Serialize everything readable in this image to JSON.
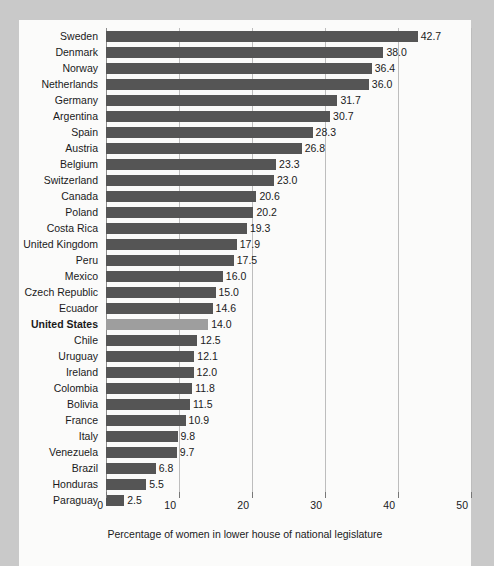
{
  "chart_data": {
    "type": "bar",
    "orientation": "horizontal",
    "title": "",
    "xlabel": "Percentage of women in lower house of national legislature",
    "ylabel": "",
    "xlim": [
      0,
      50
    ],
    "xticks": [
      0,
      10,
      20,
      30,
      40,
      50
    ],
    "xtick_labels": [
      "0",
      "10",
      "20",
      "30",
      "40",
      "50"
    ],
    "grid": true,
    "legend": null,
    "bar_color": "#555555",
    "highlight_color": "#9e9e9e",
    "highlight_category": "United States",
    "categories": [
      "Sweden",
      "Denmark",
      "Norway",
      "Netherlands",
      "Germany",
      "Argentina",
      "Spain",
      "Austria",
      "Belgium",
      "Switzerland",
      "Canada",
      "Poland",
      "Costa Rica",
      "United Kingdom",
      "Peru",
      "Mexico",
      "Czech Republic",
      "Ecuador",
      "United States",
      "Chile",
      "Uruguay",
      "Ireland",
      "Colombia",
      "Bolivia",
      "France",
      "Italy",
      "Venezuela",
      "Brazil",
      "Honduras",
      "Paraguay"
    ],
    "values": [
      42.7,
      38.0,
      36.4,
      36.0,
      31.7,
      30.7,
      28.3,
      26.8,
      23.3,
      23.0,
      20.6,
      20.2,
      19.3,
      17.9,
      17.5,
      16.0,
      15.0,
      14.6,
      14.0,
      12.5,
      12.1,
      12.0,
      11.8,
      11.5,
      10.9,
      9.8,
      9.7,
      6.8,
      5.5,
      2.5
    ],
    "value_labels": [
      "42.7",
      "38.0",
      "36.4",
      "36.0",
      "31.7",
      "30.7",
      "28.3",
      "26.8",
      "23.3",
      "23.0",
      "20.6",
      "20.2",
      "19.3",
      "17.9",
      "17.5",
      "16.0",
      "15.0",
      "14.6",
      "14.0",
      "12.5",
      "12.1",
      "12.0",
      "11.8",
      "11.5",
      "10.9",
      "9.8",
      "9.7",
      "6.8",
      "5.5",
      "2.5"
    ]
  }
}
